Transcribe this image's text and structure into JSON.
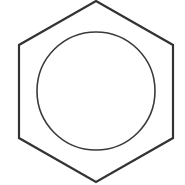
{
  "diagram": {
    "type": "benzene-ring",
    "hexagon": {
      "points": "96,1 173,45 173,138 96,182 19,138 19,45",
      "stroke": "#333333",
      "stroke_width": 2.2
    },
    "circle": {
      "cx": 96,
      "cy": 91,
      "r": 59,
      "stroke": "#3a3a3a",
      "stroke_width": 1.6
    },
    "background": "#ffffff"
  }
}
